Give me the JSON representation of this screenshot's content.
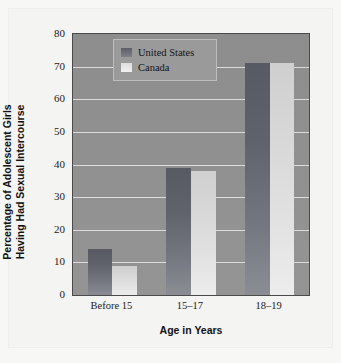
{
  "chart_data": {
    "type": "bar",
    "title": "",
    "categories": [
      "Before 15",
      "15–17",
      "18–19"
    ],
    "series": [
      {
        "name": "United States",
        "values": [
          14,
          39,
          71
        ],
        "color": "#5b5e67"
      },
      {
        "name": "Canada",
        "values": [
          9,
          38,
          71
        ],
        "color": "#e2e2e2"
      }
    ],
    "xlabel": "Age in Years",
    "ylabel_line1": "Percentage of Adolescent Girls",
    "ylabel_line2": "Having Had Sexual Intercourse",
    "ylim": [
      0,
      80
    ],
    "ytick_step": 10,
    "yticks": [
      "80",
      "70",
      "60",
      "50",
      "40",
      "30",
      "20",
      "10",
      "0"
    ],
    "grid": true,
    "legend_position": "top-left-inside",
    "plot_background": "#909090",
    "gridline_color": "#e9e9e9",
    "figure_background": "#f4f4f2"
  },
  "legend": {
    "items": [
      {
        "label": "United States",
        "swatch": "us"
      },
      {
        "label": "Canada",
        "swatch": "ca"
      }
    ]
  },
  "axes": {
    "y": {
      "title_line1": "Percentage of Adolescent Girls",
      "title_line2": "Having Had Sexual Intercourse",
      "ticks": [
        "80",
        "70",
        "60",
        "50",
        "40",
        "30",
        "20",
        "10",
        "0"
      ]
    },
    "x": {
      "title": "Age in Years",
      "ticks": [
        "Before 15",
        "15–17",
        "18–19"
      ]
    }
  }
}
